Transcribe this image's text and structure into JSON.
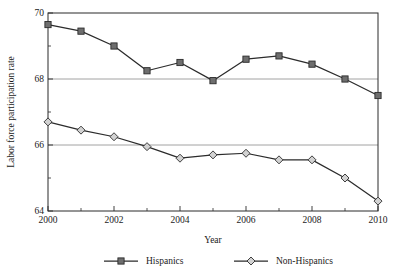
{
  "chart_data": {
    "type": "line",
    "title": "",
    "xlabel": "Year",
    "ylabel": "Labor force participation rate",
    "x": [
      2000,
      2001,
      2002,
      2003,
      2004,
      2005,
      2006,
      2007,
      2008,
      2009,
      2010
    ],
    "xtick_labels": [
      "2000",
      "2002",
      "2004",
      "2006",
      "2008",
      "2010"
    ],
    "xtick_values": [
      2000,
      2002,
      2004,
      2006,
      2008,
      2010
    ],
    "xtick_minor_values": [
      2001,
      2003,
      2005,
      2007,
      2009
    ],
    "ytick_labels": [
      "70",
      "68",
      "66",
      "64"
    ],
    "ytick_values": [
      70,
      68,
      66,
      64
    ],
    "ytick_minor_values": [
      69,
      67,
      65
    ],
    "xlim": [
      2000,
      2010
    ],
    "ylim": [
      64,
      70
    ],
    "grid": "horizontal-major",
    "gridlines_at": [
      68,
      66
    ],
    "legend_position": "bottom",
    "series": [
      {
        "name": "Hispanics",
        "marker": "filled-square",
        "marker_color": "#6e6e6e",
        "line_color": "#2b2b2b",
        "values": [
          69.65,
          69.45,
          69.0,
          68.25,
          68.5,
          67.95,
          68.6,
          68.7,
          68.45,
          68.0,
          67.5
        ]
      },
      {
        "name": "Non-Hispanics",
        "marker": "open-diamond",
        "marker_color": "#d2d2d2",
        "line_color": "#2b2b2b",
        "values": [
          66.7,
          66.45,
          66.25,
          65.95,
          65.6,
          65.7,
          65.75,
          65.55,
          65.55,
          65.0,
          64.3
        ]
      }
    ]
  },
  "legend": {
    "items": [
      {
        "label": "Hispanics"
      },
      {
        "label": "Non-Hispanics"
      }
    ]
  },
  "axes": {
    "x_title": "Year",
    "y_title": "Labor force participation rate"
  }
}
